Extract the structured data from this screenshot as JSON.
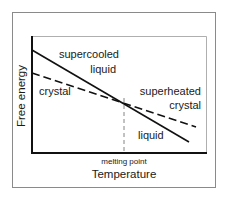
{
  "diagram": {
    "type": "free-energy-vs-temperature",
    "axes": {
      "x_title": "Temperature",
      "y_title": "Free energy",
      "x_marker_label": "melting point"
    },
    "curves": [
      {
        "name": "liquid",
        "style": "solid"
      },
      {
        "name": "crystal",
        "style": "dashed"
      }
    ],
    "labels": {
      "supercooled_line1": "supercooled",
      "supercooled_line2": "liquid",
      "crystal_left": "crystal",
      "superheated_line1": "superheated",
      "superheated_line2": "crystal",
      "liquid_right": "liquid"
    },
    "colors": {
      "line": "#111111",
      "frame": "#888888",
      "dashed_marker": "#777777"
    }
  }
}
